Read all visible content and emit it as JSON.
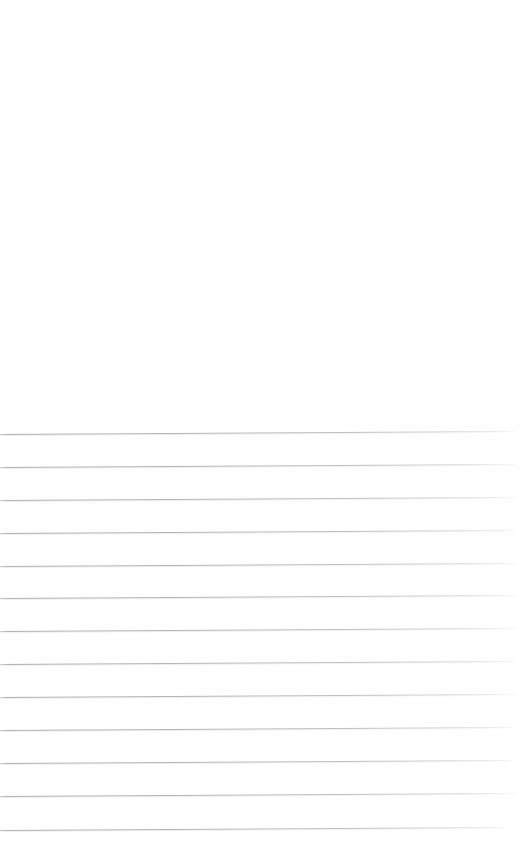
{
  "page": {
    "width": 521,
    "height": 866,
    "background_color": "#ffffff",
    "content_text": "",
    "blank_region": {
      "label": "Blank upper area",
      "top": 0,
      "height": 425
    }
  },
  "ruling": {
    "label": "Ruled writing lines",
    "line_count": 13,
    "line_color": "#b4b4b8",
    "line_thickness_px": 1,
    "spacing_px": 32.6,
    "first_line_y": 434,
    "last_line_y": 830,
    "left_x": 0,
    "right_x": 517,
    "skew_deg": -0.33,
    "lines": [
      {
        "index": 1,
        "y_left": 434,
        "y_right": 431,
        "x_start": 0,
        "x_end": 517
      },
      {
        "index": 2,
        "y_left": 467,
        "y_right": 464,
        "x_start": 0,
        "x_end": 517
      },
      {
        "index": 3,
        "y_left": 500,
        "y_right": 497,
        "x_start": 0,
        "x_end": 517
      },
      {
        "index": 4,
        "y_left": 533,
        "y_right": 530,
        "x_start": 0,
        "x_end": 517
      },
      {
        "index": 5,
        "y_left": 566,
        "y_right": 563,
        "x_start": 0,
        "x_end": 517
      },
      {
        "index": 6,
        "y_left": 598,
        "y_right": 595,
        "x_start": 0,
        "x_end": 517
      },
      {
        "index": 7,
        "y_left": 631,
        "y_right": 628,
        "x_start": 0,
        "x_end": 517
      },
      {
        "index": 8,
        "y_left": 664,
        "y_right": 661,
        "x_start": 0,
        "x_end": 517
      },
      {
        "index": 9,
        "y_left": 697,
        "y_right": 694,
        "x_start": 0,
        "x_end": 517
      },
      {
        "index": 10,
        "y_left": 730,
        "y_right": 727,
        "x_start": 0,
        "x_end": 517
      },
      {
        "index": 11,
        "y_left": 763,
        "y_right": 760,
        "x_start": 0,
        "x_end": 517
      },
      {
        "index": 12,
        "y_left": 796,
        "y_right": 793,
        "x_start": 0,
        "x_end": 517
      },
      {
        "index": 13,
        "y_left": 830,
        "y_right": 827,
        "x_start": 0,
        "x_end": 510
      }
    ]
  }
}
